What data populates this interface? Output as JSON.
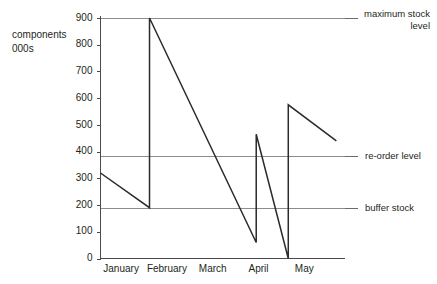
{
  "chart_data": {
    "type": "line",
    "title": "",
    "subtitle": "",
    "xlabel": "",
    "ylabel": "components 000s",
    "ylabel_lines": [
      "components",
      "000s"
    ],
    "xlim": [
      0,
      5
    ],
    "ylim": [
      0,
      900
    ],
    "grid": false,
    "legend_position": "right",
    "y_ticks": [
      0,
      100,
      200,
      300,
      400,
      500,
      600,
      700,
      800,
      900
    ],
    "y_tick_labels": [
      "0",
      "100",
      "200",
      "300",
      "400",
      "500",
      "600",
      "700",
      "800",
      "900"
    ],
    "categories": [
      "January",
      "February",
      "March",
      "April",
      "May"
    ],
    "series": [
      {
        "name": "stock level",
        "comment": "sawtooth stock level cycle; x in month units from axis origin",
        "points": [
          {
            "x": 0.0,
            "y": 320
          },
          {
            "x": 1.07,
            "y": 190
          },
          {
            "x": 1.07,
            "y": 900
          },
          {
            "x": 3.4,
            "y": 60
          },
          {
            "x": 3.4,
            "y": 465
          },
          {
            "x": 4.1,
            "y": 0
          },
          {
            "x": 4.1,
            "y": 575
          },
          {
            "x": 5.15,
            "y": 440
          }
        ]
      }
    ],
    "reference_lines": [
      {
        "id": "maximum-stock-level",
        "label": "maximum stock level",
        "label_lines": [
          "maximum stock",
          "level"
        ],
        "value": 900
      },
      {
        "id": "re-order-level",
        "label": "re-order level",
        "label_lines": [
          "re-order level"
        ],
        "value": 385
      },
      {
        "id": "buffer-stock",
        "label": "buffer stock",
        "label_lines": [
          "buffer stock"
        ],
        "value": 190
      }
    ],
    "colors": {
      "data_line": "#2b2b2b",
      "reference_line": "#8c8c8c",
      "axis": "#4a4a4a",
      "text": "#231f20",
      "background": "#ffffff"
    }
  }
}
